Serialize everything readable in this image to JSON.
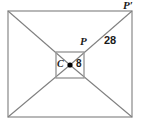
{
  "figure": {
    "type": "geometry-diagram",
    "colors": {
      "stroke": "#9a9a9a",
      "diagonal_stroke": "#808080",
      "point_fill": "#000000",
      "label_color": "#1a1a1a",
      "background": "#ffffff"
    },
    "outer_rectangle": {
      "name": "outer-rectangle",
      "x": 8,
      "y": 11,
      "width": 124,
      "height": 106
    },
    "inner_rectangle": {
      "name": "inner-rectangle",
      "x": 56,
      "y": 52,
      "width": 28,
      "height": 26
    },
    "center_point": {
      "name": "center-point",
      "label": "C",
      "x": 70,
      "y": 65,
      "radius": 2.6
    },
    "labels": [
      {
        "id": "p-prime",
        "text": "P′",
        "style": "italic"
      },
      {
        "id": "p",
        "text": "P",
        "style": "italic"
      },
      {
        "id": "segment-28",
        "text": "28",
        "style": "number"
      },
      {
        "id": "center-c",
        "text": "C",
        "style": "italic"
      },
      {
        "id": "segment-8",
        "text": "8",
        "style": "number"
      }
    ],
    "measurements": {
      "cp_prime": "28",
      "cp": "8"
    },
    "rays": [
      {
        "from": "C",
        "through": "inner-top-right",
        "to": "P′ (outer-top-right)"
      },
      {
        "from": "C",
        "through": "inner-top-left",
        "to": "outer-top-left"
      },
      {
        "from": "C",
        "through": "inner-bottom-left",
        "to": "outer-bottom-left"
      },
      {
        "from": "C",
        "through": "inner-bottom-right",
        "to": "outer-bottom-right"
      }
    ]
  }
}
